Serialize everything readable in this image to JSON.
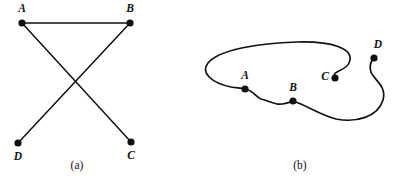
{
  "figure": {
    "background_color": "#ffffff",
    "ink_color": "#111111",
    "width": 401,
    "height": 176
  },
  "panels": [
    {
      "id": "panel-a",
      "caption": "(a)",
      "caption_x": 77,
      "caption_y": 169,
      "type": "straight-line-drawing",
      "vertices": [
        {
          "name": "A",
          "x": 22,
          "y": 23,
          "label": "A",
          "label_x": 22,
          "label_y": 12,
          "label_anchor": "middle"
        },
        {
          "name": "B",
          "x": 130,
          "y": 23,
          "label": "B",
          "label_x": 130,
          "label_y": 12,
          "label_anchor": "middle"
        },
        {
          "name": "C",
          "x": 131,
          "y": 142,
          "label": "C",
          "label_x": 131,
          "label_y": 159,
          "label_anchor": "middle"
        },
        {
          "name": "D",
          "x": 18,
          "y": 143,
          "label": "D",
          "label_x": 18,
          "label_y": 160,
          "label_anchor": "middle"
        }
      ],
      "edges": [
        {
          "from": "A",
          "to": "B",
          "x1": 22,
          "y1": 23,
          "x2": 130,
          "y2": 23
        },
        {
          "from": "A",
          "to": "C",
          "x1": 22,
          "y1": 23,
          "x2": 131,
          "y2": 142
        },
        {
          "from": "B",
          "to": "D",
          "x1": 130,
          "y1": 23,
          "x2": 18,
          "y2": 143
        }
      ],
      "crossings": 1
    },
    {
      "id": "panel-b",
      "caption": "(b)",
      "caption_x": 300,
      "caption_y": 169,
      "type": "curved-arc-drawing",
      "vertices": [
        {
          "name": "A",
          "x": 245,
          "y": 89,
          "label": "A",
          "label_x": 245,
          "label_y": 79,
          "label_anchor": "middle"
        },
        {
          "name": "B",
          "x": 293,
          "y": 101,
          "label": "B",
          "label_x": 293,
          "label_y": 91,
          "label_anchor": "middle"
        },
        {
          "name": "C",
          "x": 335,
          "y": 78,
          "label": "C",
          "label_x": 325,
          "label_y": 80,
          "label_anchor": "middle"
        },
        {
          "name": "D",
          "x": 374,
          "y": 58,
          "label": "D",
          "label_x": 378,
          "label_y": 48,
          "label_anchor": "middle"
        }
      ],
      "curves": [
        {
          "from": "C",
          "to": "A",
          "note": "long arc from C up over the top and around the left side down to A",
          "d": "M 335,78 C 331,70 345,72 349,63 C 356,48 330,41 297,42 C 258,43 218,50 208,63 C 200,73 212,83 231,87 C 238,88 242,88 245,89"
        },
        {
          "from": "A",
          "to": "B",
          "note": "short S-shaped wiggle between A and B",
          "d": "M 245,89 C 253,90 256,97 261,99 C 268,101 272,103 277,104 C 283,105 288,103 293,101"
        },
        {
          "from": "B",
          "to": "D",
          "note": "arc sweeping right and around the bottom-right back up to D",
          "d": "M 293,101 C 306,105 320,115 336,119 C 356,123 378,117 383,100 C 387,86 374,80 371,72 C 369,66 371,61 374,58"
        }
      ],
      "crossings": 0
    }
  ]
}
